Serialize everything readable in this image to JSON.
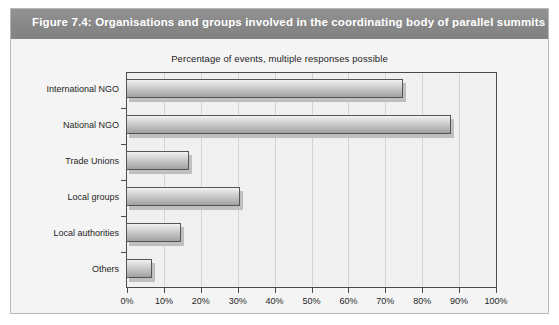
{
  "figure": {
    "title": "Figure 7.4: Organisations and groups involved in the coordinating body of parallel summits",
    "banner_color": "#8b8b8b",
    "title_color": "#ffffff",
    "background_color": "#f4f4f4",
    "border_color": "#b9b9b9"
  },
  "chart_data": {
    "type": "bar",
    "orientation": "horizontal",
    "title": "",
    "subtitle": "Percentage of events, multiple responses possible",
    "categories": [
      "International NGO",
      "National NGO",
      "Trade Unions",
      "Local groups",
      "Local authorities",
      "Others"
    ],
    "values": [
      75,
      88,
      17,
      31,
      15,
      7
    ],
    "xlabel": "",
    "ylabel": "",
    "xlim": [
      0,
      100
    ],
    "xticks": [
      0,
      10,
      20,
      30,
      40,
      50,
      60,
      70,
      80,
      90,
      100
    ],
    "xticklabels": [
      "0%",
      "10%",
      "20%",
      "30%",
      "40%",
      "50%",
      "60%",
      "70%",
      "80%",
      "90%",
      "100%"
    ],
    "grid": "vertical",
    "legend": false,
    "bar_style": "3d-gradient-gray",
    "bar_fill_light": "#f4f4f4",
    "bar_fill_dark": "#9e9e9e",
    "bar_border_color": "#555555",
    "gridline_color": "#d2d2d2",
    "axis_color": "#4a4a4a",
    "plot_background": "#f0f0f0"
  }
}
